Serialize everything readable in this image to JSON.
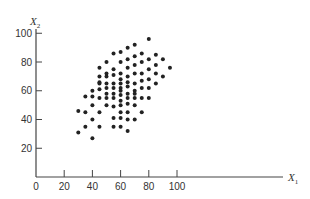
{
  "chart_data": {
    "type": "scatter",
    "title": "",
    "xlabel": "X1",
    "ylabel": "X2",
    "xlabel_main": "X",
    "xlabel_sub": "1",
    "ylabel_main": "X",
    "ylabel_sub": "2",
    "xlim": [
      0,
      120
    ],
    "ylim": [
      0,
      110
    ],
    "xticks": [
      0,
      20,
      40,
      60,
      80,
      100
    ],
    "yticks": [
      20,
      40,
      60,
      80,
      100
    ],
    "grid": false,
    "legend": null,
    "points": [
      [
        30,
        31
      ],
      [
        30,
        46
      ],
      [
        35,
        35
      ],
      [
        35,
        45
      ],
      [
        35,
        56
      ],
      [
        40,
        27
      ],
      [
        40,
        40
      ],
      [
        40,
        50
      ],
      [
        40,
        56
      ],
      [
        40,
        60
      ],
      [
        45,
        35
      ],
      [
        45,
        45
      ],
      [
        45,
        55
      ],
      [
        45,
        61
      ],
      [
        45,
        65
      ],
      [
        45,
        66
      ],
      [
        45,
        70
      ],
      [
        45,
        76
      ],
      [
        50,
        50
      ],
      [
        50,
        55
      ],
      [
        50,
        58
      ],
      [
        50,
        62
      ],
      [
        50,
        65
      ],
      [
        50,
        70
      ],
      [
        50,
        72
      ],
      [
        50,
        80
      ],
      [
        55,
        35
      ],
      [
        55,
        41
      ],
      [
        55,
        49
      ],
      [
        55,
        55
      ],
      [
        55,
        58
      ],
      [
        55,
        62
      ],
      [
        55,
        65
      ],
      [
        55,
        71
      ],
      [
        55,
        75
      ],
      [
        55,
        86
      ],
      [
        60,
        35
      ],
      [
        60,
        41
      ],
      [
        60,
        45
      ],
      [
        60,
        50
      ],
      [
        60,
        53
      ],
      [
        60,
        57
      ],
      [
        60,
        60
      ],
      [
        60,
        62
      ],
      [
        60,
        65
      ],
      [
        60,
        68
      ],
      [
        60,
        72
      ],
      [
        60,
        80
      ],
      [
        60,
        87
      ],
      [
        65,
        32
      ],
      [
        65,
        40
      ],
      [
        65,
        45
      ],
      [
        65,
        51
      ],
      [
        65,
        55
      ],
      [
        65,
        58
      ],
      [
        65,
        63
      ],
      [
        65,
        66
      ],
      [
        65,
        70
      ],
      [
        65,
        76
      ],
      [
        65,
        82
      ],
      [
        65,
        90
      ],
      [
        70,
        40
      ],
      [
        70,
        50
      ],
      [
        70,
        55
      ],
      [
        70,
        58
      ],
      [
        70,
        60
      ],
      [
        70,
        65
      ],
      [
        70,
        72
      ],
      [
        70,
        78
      ],
      [
        70,
        84
      ],
      [
        70,
        92
      ],
      [
        75,
        45
      ],
      [
        75,
        55
      ],
      [
        75,
        62
      ],
      [
        75,
        67
      ],
      [
        75,
        72
      ],
      [
        75,
        80
      ],
      [
        75,
        86
      ],
      [
        80,
        55
      ],
      [
        80,
        62
      ],
      [
        80,
        68
      ],
      [
        80,
        75
      ],
      [
        80,
        82
      ],
      [
        80,
        96
      ],
      [
        85,
        65
      ],
      [
        85,
        72
      ],
      [
        85,
        78
      ],
      [
        85,
        85
      ],
      [
        90,
        70
      ],
      [
        90,
        82
      ],
      [
        95,
        76
      ]
    ]
  }
}
